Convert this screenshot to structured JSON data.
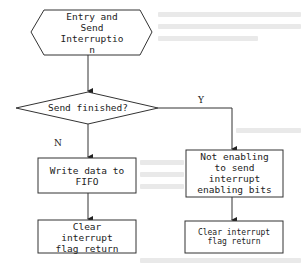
{
  "diagram": {
    "type": "flowchart",
    "nodes": {
      "start": {
        "shape": "hexagon",
        "text": "Entry and\nSend\nInterruptio\nn"
      },
      "decision": {
        "shape": "diamond",
        "text": "Send finished?"
      },
      "write_fifo": {
        "shape": "rectangle",
        "text": "Write data to\nFIFO"
      },
      "clear_left": {
        "shape": "rectangle",
        "text": "Clear\ninterrupt\nflag return"
      },
      "disable_int": {
        "shape": "rectangle",
        "text": "Not enabling\nto send\ninterrupt\nenabling bits"
      },
      "clear_right": {
        "shape": "rectangle",
        "text": "Clear interrupt\nflag return"
      }
    },
    "edges": [
      {
        "from": "start",
        "to": "decision",
        "label": ""
      },
      {
        "from": "decision",
        "to": "write_fifo",
        "label": "N"
      },
      {
        "from": "write_fifo",
        "to": "clear_left",
        "label": ""
      },
      {
        "from": "decision",
        "to": "disable_int",
        "label": "Y"
      },
      {
        "from": "disable_int",
        "to": "clear_right",
        "label": ""
      }
    ],
    "edge_labels": {
      "no": "N",
      "yes": "Y"
    },
    "colors": {
      "stroke": "#333333",
      "text": "#222222",
      "background": "#ffffff"
    }
  }
}
